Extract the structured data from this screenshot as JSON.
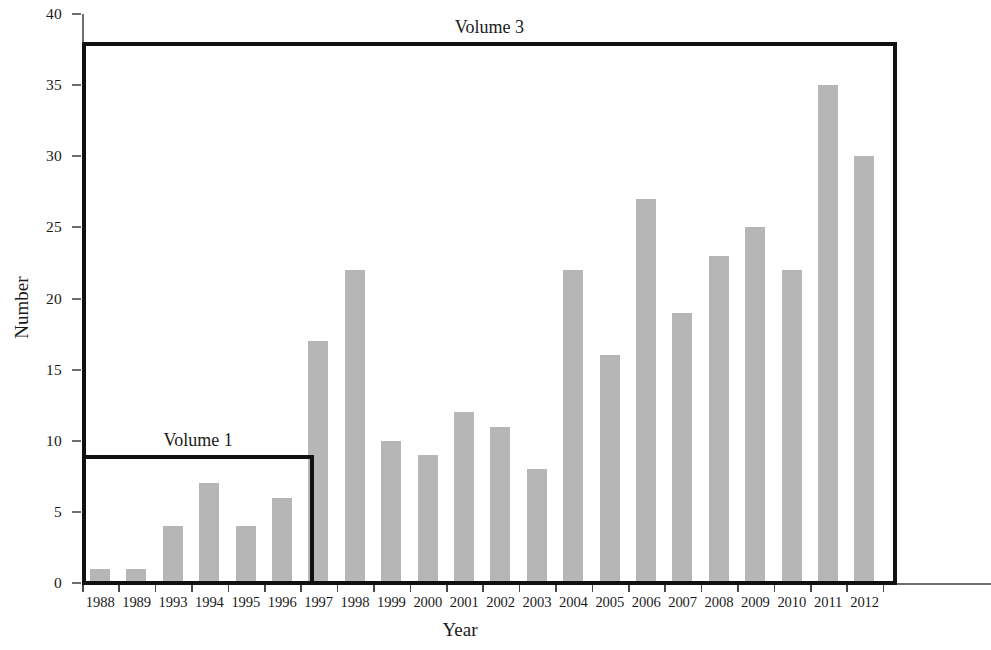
{
  "chart_data": {
    "type": "bar",
    "title": "",
    "xlabel": "Year",
    "ylabel": "Number",
    "categories": [
      "1988",
      "1989",
      "1993",
      "1994",
      "1995",
      "1996",
      "1997",
      "1998",
      "1999",
      "2000",
      "2001",
      "2002",
      "2003",
      "2004",
      "2005",
      "2006",
      "2007",
      "2008",
      "2009",
      "2010",
      "2011",
      "2012"
    ],
    "values": [
      1,
      1,
      4,
      7,
      4,
      6,
      17,
      22,
      10,
      9,
      12,
      11,
      8,
      22,
      16,
      27,
      19,
      23,
      25,
      22,
      35,
      30
    ],
    "ylim": [
      0,
      40
    ],
    "ytick_labels": [
      "0",
      "5",
      "10",
      "15",
      "20",
      "25",
      "30",
      "35",
      "40"
    ],
    "ytick_values": [
      0,
      5,
      10,
      15,
      20,
      25,
      30,
      35,
      40
    ],
    "grid": false,
    "legend": false,
    "bar_color": "#b6b6b6",
    "axis_color": "#6e6e6e",
    "annotation_color": "#111111",
    "annotations": [
      {
        "label": "Volume 1",
        "from_category": "1988",
        "to_category": "1996",
        "height": 9
      },
      {
        "label": "Volume 3",
        "from_category": "1988",
        "to_category": "2012",
        "height": 38
      }
    ],
    "note_cropped_right": "chart continues past right edge of image"
  }
}
